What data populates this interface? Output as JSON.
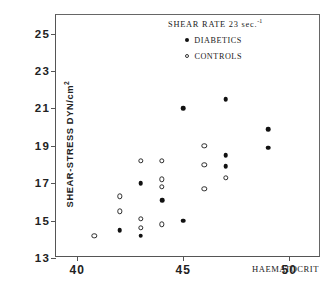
{
  "chart_data": {
    "type": "scatter",
    "title": "SHEAR RATE 23 sec.",
    "title_superscript": "-1",
    "xlabel": "HAEMATOCRIT",
    "ylabel": "SHEAR-STRESS  DYN/cm",
    "ylabel_superscript": "2",
    "xlim": [
      39.0,
      51.5
    ],
    "ylim": [
      13,
      26
    ],
    "xticks": [
      40,
      45,
      50
    ],
    "yticks": [
      13,
      15,
      17,
      19,
      21,
      23,
      25
    ],
    "xtick_labels": [
      "40",
      "45",
      "50"
    ],
    "ytick_labels": [
      "13",
      "15",
      "17",
      "19",
      "21",
      "23",
      "25"
    ],
    "grid": false,
    "legend_position": "top-right",
    "series": [
      {
        "name": "DIABETICS",
        "marker": "filled-circle",
        "color": "#111111",
        "points": [
          [
            42.0,
            14.5
          ],
          [
            43.0,
            14.2
          ],
          [
            43.0,
            17.0
          ],
          [
            44.0,
            16.1
          ],
          [
            45.0,
            15.0
          ],
          [
            45.0,
            21.0
          ],
          [
            47.0,
            21.5
          ],
          [
            47.0,
            18.5
          ],
          [
            47.0,
            17.9
          ],
          [
            49.0,
            19.9
          ],
          [
            49.0,
            18.9
          ]
        ]
      },
      {
        "name": "CONTROLS",
        "marker": "open-circle",
        "color": "#2b2b2b",
        "points": [
          [
            40.8,
            14.2
          ],
          [
            42.0,
            16.3
          ],
          [
            42.0,
            15.5
          ],
          [
            43.0,
            18.2
          ],
          [
            43.0,
            15.1
          ],
          [
            43.0,
            14.6
          ],
          [
            44.0,
            18.2
          ],
          [
            44.0,
            17.2
          ],
          [
            44.0,
            16.8
          ],
          [
            44.0,
            14.8
          ],
          [
            46.0,
            19.0
          ],
          [
            46.0,
            18.0
          ],
          [
            46.0,
            16.7
          ],
          [
            47.0,
            17.3
          ]
        ]
      }
    ]
  }
}
